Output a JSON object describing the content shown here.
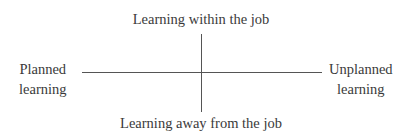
{
  "diagram": {
    "type": "two-axis quadrant",
    "vertical_axis": {
      "top_label": "Learning within the job",
      "bottom_label": "Learning away from the job"
    },
    "horizontal_axis": {
      "left_label": [
        "Planned",
        "learning"
      ],
      "right_label": [
        "Unplanned",
        "learning"
      ]
    },
    "colors": {
      "text": "#3a3a3a",
      "axis_line": "#555555",
      "background": "#ffffff"
    }
  }
}
